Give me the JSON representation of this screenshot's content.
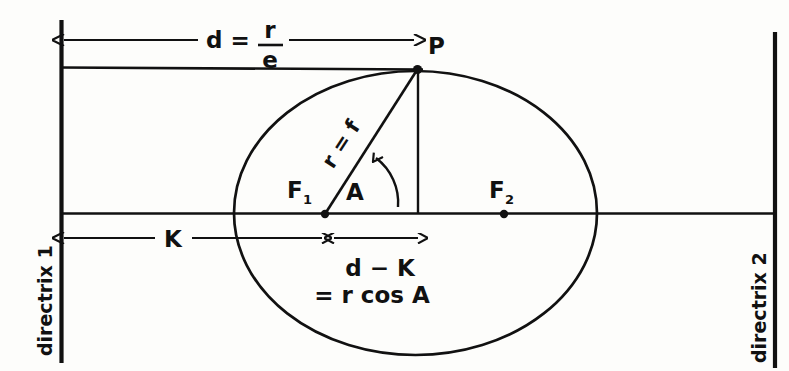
{
  "figure": {
    "width": 789,
    "height": 371,
    "ink_color": "#111111",
    "background_color": "#fdfdfb"
  },
  "labels": {
    "point_p": "P",
    "focus_1": "F",
    "focus_1_sub": "1",
    "focus_2": "F",
    "focus_2_sub": "2",
    "angle": "A",
    "radius_line": "r = f",
    "distance_d_num": "r",
    "distance_d_den": "e",
    "distance_d_lhs": "d =",
    "segment_k": "K",
    "d_minus_k": "d − K",
    "r_cos_a": "= r cos A",
    "directrix_left": "directrix 1",
    "directrix_right": "directrix 2"
  },
  "geometry": {
    "ellipse": {
      "center_x": 415.5,
      "center_y": 213,
      "radius_x": 181.5,
      "radius_y": 142
    },
    "point_p": {
      "x": 417,
      "y": 70
    },
    "focus_1": {
      "x": 325,
      "y": 214
    },
    "focus_2": {
      "x": 504,
      "y": 214
    },
    "major_axis_y": 213,
    "directrix_left_x": 61,
    "directrix_right_x": 775,
    "top_chord_y": 67,
    "d_arrow_y": 40,
    "k_arrow_y": 238
  }
}
